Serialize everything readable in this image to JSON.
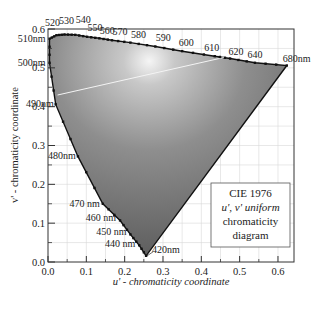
{
  "chart_data": {
    "type": "scatter",
    "title": "CIE 1976 u', v' uniform chromaticity diagram",
    "xlabel": "u' - chromaticity coordinate",
    "ylabel": "v' - chromaticity coordinate",
    "xlim": [
      0.0,
      0.64
    ],
    "ylim": [
      0.0,
      0.6
    ],
    "grid": true,
    "x_ticks": [
      "0.0",
      "0.1",
      "0.2",
      "0.3",
      "0.4",
      "0.5",
      "0.6"
    ],
    "y_ticks": [
      "0.0",
      "0.1",
      "0.2",
      "0.3",
      "0.4",
      "0.5",
      "0.6"
    ],
    "legend": {
      "position": "lower right",
      "lines": [
        "CIE 1976",
        "u', v' uniform",
        "chromaticity",
        "diagram"
      ]
    },
    "spectral_locus": {
      "name": "Spectral locus (wavelength, u', v')",
      "points": [
        {
          "nm": 420,
          "u": 0.256,
          "v": 0.016,
          "label": "420nm"
        },
        {
          "nm": 440,
          "u": 0.238,
          "v": 0.043,
          "label": "440 nm"
        },
        {
          "nm": 450,
          "u": 0.215,
          "v": 0.071,
          "label": "450 nm"
        },
        {
          "nm": 460,
          "u": 0.188,
          "v": 0.107,
          "label": "460 nm"
        },
        {
          "nm": 470,
          "u": 0.143,
          "v": 0.15,
          "label": "470 nm"
        },
        {
          "nm": 480,
          "u": 0.078,
          "v": 0.272,
          "label": "480nm"
        },
        {
          "nm": 490,
          "u": 0.02,
          "v": 0.406,
          "label": "490nm"
        },
        {
          "nm": 500,
          "u": 0.004,
          "v": 0.513,
          "label": "500nm"
        },
        {
          "nm": 510,
          "u": 0.004,
          "v": 0.575,
          "label": "510nm"
        },
        {
          "nm": 520,
          "u": 0.022,
          "v": 0.584,
          "label": "520"
        },
        {
          "nm": 530,
          "u": 0.043,
          "v": 0.586,
          "label": "530"
        },
        {
          "nm": 540,
          "u": 0.071,
          "v": 0.585,
          "label": "540"
        },
        {
          "nm": 550,
          "u": 0.102,
          "v": 0.58,
          "label": "550"
        },
        {
          "nm": 560,
          "u": 0.134,
          "v": 0.576,
          "label": "560"
        },
        {
          "nm": 570,
          "u": 0.167,
          "v": 0.571,
          "label": "570"
        },
        {
          "nm": 580,
          "u": 0.215,
          "v": 0.565,
          "label": "580"
        },
        {
          "nm": 590,
          "u": 0.28,
          "v": 0.555,
          "label": "590"
        },
        {
          "nm": 600,
          "u": 0.35,
          "v": 0.543,
          "label": "600"
        },
        {
          "nm": 610,
          "u": 0.435,
          "v": 0.53,
          "label": "610"
        },
        {
          "nm": 620,
          "u": 0.475,
          "v": 0.524,
          "label": "620"
        },
        {
          "nm": 640,
          "u": 0.54,
          "v": 0.513,
          "label": "640"
        },
        {
          "nm": 680,
          "u": 0.623,
          "v": 0.506,
          "label": "680nm"
        }
      ]
    },
    "line_of_purples": {
      "from_nm": 680,
      "to_nm": 420
    },
    "white_line": {
      "from": {
        "u": 0.025,
        "v": 0.43
      },
      "to": {
        "u": 0.46,
        "v": 0.527
      }
    },
    "colors": {
      "fill_light": "#cfcfcf",
      "fill_mid": "#8a8a8a",
      "fill_dark": "#5a5a5a",
      "locus_stroke": "#111111",
      "grid": "#d9d9d9",
      "background": "#ffffff"
    }
  }
}
